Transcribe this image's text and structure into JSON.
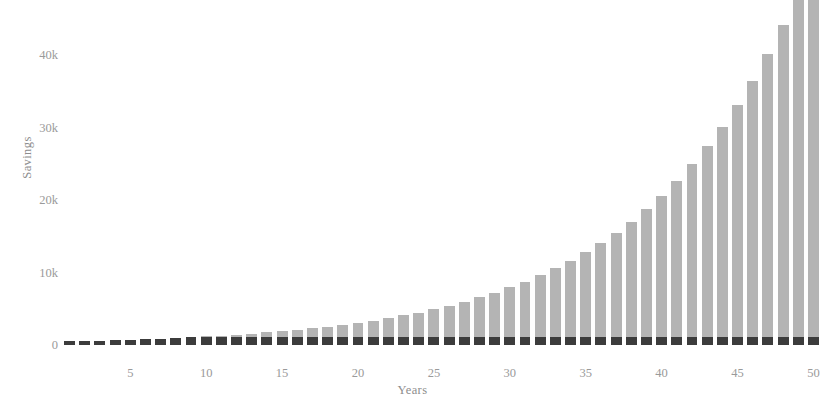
{
  "chart_data": {
    "type": "bar",
    "title": "",
    "subtitle": "",
    "xlabel": "Years",
    "ylabel": "Savings",
    "grid": false,
    "legend": null,
    "xlim": [
      0.5,
      50.5
    ],
    "ylim": [
      0,
      47500
    ],
    "x_tick_labels": [
      "5",
      "10",
      "15",
      "20",
      "25",
      "30",
      "35",
      "40",
      "45",
      "50"
    ],
    "x_tick_values": [
      5,
      10,
      15,
      20,
      25,
      30,
      35,
      40,
      45,
      50
    ],
    "y_tick_labels": [
      "0",
      "10k",
      "20k",
      "30k",
      "40k"
    ],
    "y_tick_values": [
      0,
      10000,
      20000,
      30000,
      40000
    ],
    "categories": [
      1,
      2,
      3,
      4,
      5,
      6,
      7,
      8,
      9,
      10,
      11,
      12,
      13,
      14,
      15,
      16,
      17,
      18,
      19,
      20,
      21,
      22,
      23,
      24,
      25,
      26,
      27,
      28,
      29,
      30,
      31,
      32,
      33,
      34,
      35,
      36,
      37,
      38,
      39,
      40,
      41,
      42,
      43,
      44,
      45,
      46,
      47,
      48,
      49,
      50
    ],
    "values": [
      500,
      550,
      605,
      666,
      732,
      806,
      886,
      975,
      1072,
      1180,
      1297,
      1427,
      1570,
      1727,
      1899,
      2089,
      2298,
      2528,
      2781,
      3059,
      3365,
      3702,
      4072,
      4479,
      4927,
      5420,
      5962,
      6558,
      7214,
      7935,
      8729,
      9602,
      10562,
      11618,
      12780,
      14058,
      15464,
      17010,
      18711,
      20583,
      22641,
      24905,
      27396,
      30135,
      33149,
      36464,
      40110,
      44121,
      48533,
      53386
    ],
    "bar_base_value": 500,
    "colors": {
      "bar_upper": "#b4b4b4",
      "bar_base": "#3c3c3c",
      "axis_text": "#9a9a9a",
      "axis_line": "#d7d7d7",
      "background": "#ffffff"
    }
  },
  "axes": {
    "y_title": "Savings",
    "x_title": "Years"
  }
}
